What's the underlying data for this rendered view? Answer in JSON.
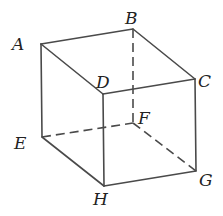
{
  "diagram": {
    "type": "cube-perspective",
    "vertices": {
      "A": {
        "x": 41,
        "y": 44,
        "label": "A",
        "lx": 12,
        "ly": 50
      },
      "B": {
        "x": 133,
        "y": 29,
        "label": "B",
        "lx": 125,
        "ly": 24
      },
      "C": {
        "x": 195,
        "y": 79,
        "label": "C",
        "lx": 198,
        "ly": 87
      },
      "D": {
        "x": 103,
        "y": 94,
        "label": "D",
        "lx": 96,
        "ly": 88
      },
      "E": {
        "x": 42,
        "y": 137,
        "label": "E",
        "lx": 14,
        "ly": 149
      },
      "F": {
        "x": 133,
        "y": 123,
        "label": "F",
        "lx": 138,
        "ly": 124
      },
      "G": {
        "x": 196,
        "y": 171,
        "label": "G",
        "lx": 199,
        "ly": 186
      },
      "H": {
        "x": 104,
        "y": 186,
        "label": "H",
        "lx": 93,
        "ly": 205
      }
    },
    "edges_visible": [
      [
        "A",
        "B"
      ],
      [
        "B",
        "C"
      ],
      [
        "C",
        "D"
      ],
      [
        "D",
        "A"
      ],
      [
        "A",
        "E"
      ],
      [
        "D",
        "H"
      ],
      [
        "C",
        "G"
      ],
      [
        "E",
        "H"
      ],
      [
        "H",
        "G"
      ]
    ],
    "edges_hidden": [
      [
        "B",
        "F"
      ],
      [
        "E",
        "F"
      ],
      [
        "F",
        "G"
      ]
    ],
    "colors": {
      "line": "#4a4a4a",
      "label": "#222222",
      "background": "#ffffff"
    }
  }
}
